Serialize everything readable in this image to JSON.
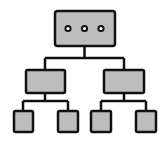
{
  "diagram": {
    "type": "hierarchy-tree",
    "colors": {
      "background": "#ffffff",
      "node_fill": "#bdbdbd",
      "stroke": "#111111",
      "dot_fill": "#ffffff"
    },
    "root": {
      "label": "",
      "dots": 3
    },
    "levels": [
      1,
      2,
      4
    ]
  }
}
